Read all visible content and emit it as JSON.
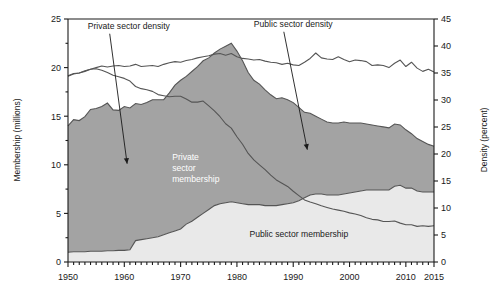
{
  "chart_data": {
    "type": "area",
    "title": "",
    "subtitle": "",
    "xlabel": "",
    "ylabel": "Membership (millions)",
    "y2label": "Density (percent)",
    "xlim": [
      1950,
      2015
    ],
    "ylim": [
      0,
      25
    ],
    "y2lim": [
      0,
      45
    ],
    "grid": false,
    "legend_position": "inline-annotations",
    "x_ticks_major": [
      1950,
      1960,
      1970,
      1980,
      1990,
      2000,
      2010,
      2015
    ],
    "x_tick_labels": [
      "1950",
      "1960",
      "1970",
      "1980",
      "1990",
      "2000",
      "2010",
      "2015"
    ],
    "x_ticks_minor_interval": 1,
    "y_ticks_major": [
      0,
      5,
      10,
      15,
      20,
      25
    ],
    "y_tick_labels": [
      "0",
      "5",
      "10",
      "15",
      "20",
      "25"
    ],
    "y_ticks_minor": [
      2.5,
      7.5,
      12.5,
      17.5,
      22.5
    ],
    "y2_ticks_major": [
      0,
      5,
      10,
      15,
      20,
      25,
      30,
      35,
      40,
      45
    ],
    "y2_tick_labels": [
      "0",
      "5",
      "10",
      "15",
      "20",
      "25",
      "30",
      "35",
      "40",
      "45"
    ],
    "annotations": [
      {
        "name": "private-sector-density-annotation",
        "text": "Private sector density",
        "x": 1953.5,
        "y": 24.0,
        "arrow_to_x": 1960.5,
        "arrow_to_y": 18.2
      },
      {
        "name": "public-sector-density-annotation",
        "text": "Public sector density",
        "x": 1983.0,
        "y": 24.2,
        "arrow_to_x": 1992.5,
        "arrow_to_y": 20.8
      },
      {
        "name": "private-sector-membership-label",
        "text": "Private sector membership",
        "x": 1968.5,
        "y": 10.5
      },
      {
        "name": "public-sector-membership-label",
        "text": "Public sector membership",
        "x": 1991.0,
        "y": 2.6
      }
    ],
    "colors": {
      "private_area": "#a3a3a3",
      "public_area": "#e9e9e9",
      "line": "#555555",
      "axis": "#1a1a1a",
      "label_light": "#ffffff",
      "label_dark": "#1a1a1a"
    },
    "x": [
      1950,
      1951,
      1952,
      1953,
      1954,
      1955,
      1956,
      1957,
      1958,
      1959,
      1960,
      1961,
      1962,
      1963,
      1964,
      1965,
      1966,
      1967,
      1968,
      1969,
      1970,
      1971,
      1972,
      1973,
      1974,
      1975,
      1976,
      1977,
      1978,
      1979,
      1980,
      1981,
      1982,
      1983,
      1984,
      1985,
      1986,
      1987,
      1988,
      1989,
      1990,
      1991,
      1992,
      1993,
      1994,
      1995,
      1996,
      1997,
      1998,
      1999,
      2000,
      2001,
      2002,
      2003,
      2004,
      2005,
      2006,
      2007,
      2008,
      2009,
      2010,
      2011,
      2012,
      2013,
      2014,
      2015
    ],
    "series": [
      {
        "name": "Public sector membership",
        "axis": "left",
        "units": "millions",
        "type": "stacked-area",
        "color": "#e9e9e9",
        "values": [
          1.0,
          1.05,
          1.05,
          1.05,
          1.1,
          1.1,
          1.1,
          1.15,
          1.15,
          1.2,
          1.2,
          1.25,
          2.2,
          2.3,
          2.4,
          2.5,
          2.6,
          2.8,
          3.0,
          3.2,
          3.4,
          3.9,
          4.2,
          4.6,
          5.0,
          5.4,
          5.8,
          6.0,
          6.1,
          6.2,
          6.1,
          6.0,
          5.9,
          5.9,
          5.9,
          5.8,
          5.8,
          5.8,
          5.9,
          6.0,
          6.1,
          6.3,
          6.6,
          6.9,
          7.0,
          7.0,
          6.9,
          6.9,
          6.9,
          7.0,
          7.1,
          7.2,
          7.3,
          7.4,
          7.4,
          7.4,
          7.4,
          7.4,
          7.8,
          7.9,
          7.6,
          7.6,
          7.3,
          7.2,
          7.2,
          7.2
        ]
      },
      {
        "name": "Private sector membership",
        "axis": "left",
        "units": "millions",
        "type": "stacked-area",
        "color": "#a3a3a3",
        "values": [
          13.0,
          13.6,
          13.5,
          13.9,
          14.6,
          14.7,
          14.9,
          15.2,
          14.5,
          14.4,
          14.8,
          14.6,
          14.1,
          13.9,
          14.0,
          14.2,
          14.1,
          13.9,
          14.4,
          15.0,
          15.3,
          15.2,
          15.4,
          15.5,
          15.7,
          15.6,
          15.7,
          15.9,
          16.1,
          16.3,
          15.6,
          14.7,
          13.6,
          12.8,
          12.4,
          11.9,
          11.4,
          11.0,
          11.0,
          10.7,
          10.3,
          9.6,
          8.8,
          8.4,
          8.0,
          7.7,
          7.5,
          7.4,
          7.4,
          7.4,
          7.2,
          7.1,
          7.0,
          6.8,
          6.7,
          6.6,
          6.5,
          6.4,
          6.4,
          6.2,
          6.0,
          5.6,
          5.4,
          5.2,
          4.9,
          4.7
        ]
      },
      {
        "name": "Private sector density",
        "axis": "right",
        "units": "percent",
        "type": "line",
        "color": "#555555",
        "values": [
          34.4,
          34.8,
          35.0,
          35.3,
          35.7,
          35.8,
          35.5,
          35.1,
          34.6,
          34.3,
          34.0,
          33.5,
          32.5,
          32.1,
          31.9,
          31.6,
          31.0,
          30.8,
          30.6,
          30.7,
          30.7,
          30.2,
          29.6,
          29.6,
          29.8,
          28.9,
          28.0,
          26.9,
          25.6,
          24.8,
          23.2,
          21.8,
          20.1,
          18.9,
          18.0,
          17.1,
          16.1,
          15.2,
          14.6,
          14.0,
          13.1,
          12.3,
          11.5,
          11.1,
          10.8,
          10.4,
          10.1,
          9.8,
          9.6,
          9.4,
          9.1,
          8.9,
          8.6,
          8.2,
          7.9,
          7.8,
          7.5,
          7.5,
          7.6,
          7.2,
          6.9,
          6.9,
          6.6,
          6.7,
          6.6,
          6.7
        ]
      },
      {
        "name": "Public sector density",
        "axis": "right",
        "units": "percent",
        "type": "line",
        "color": "#555555",
        "values": [
          34.5,
          34.9,
          35.0,
          35.4,
          35.7,
          36.0,
          36.3,
          36.1,
          36.3,
          36.4,
          36.2,
          36.3,
          36.6,
          36.2,
          36.3,
          36.4,
          36.2,
          36.6,
          36.9,
          37.1,
          37.0,
          37.3,
          37.5,
          37.8,
          38.0,
          38.2,
          38.5,
          38.6,
          38.3,
          38.6,
          38.0,
          37.7,
          37.6,
          37.4,
          37.5,
          37.2,
          37.0,
          36.9,
          36.6,
          36.8,
          36.5,
          36.4,
          37.0,
          37.7,
          38.7,
          37.8,
          37.6,
          37.5,
          38.0,
          37.5,
          37.1,
          37.4,
          37.3,
          37.1,
          36.4,
          36.5,
          36.4,
          36.0,
          36.8,
          37.4,
          36.2,
          37.0,
          35.9,
          35.3,
          35.7,
          35.2
        ]
      }
    ]
  },
  "axes": {
    "left_title": "Membership (millions)",
    "right_title": "Density (percent)"
  }
}
